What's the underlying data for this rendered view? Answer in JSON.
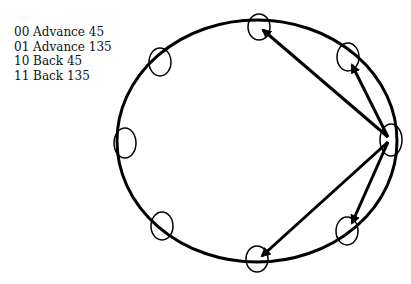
{
  "legend": {
    "items": [
      {
        "code": "00",
        "label": "Advance 45"
      },
      {
        "code": "01",
        "label": "Advance 135"
      },
      {
        "code": "10",
        "label": "Back 45"
      },
      {
        "code": "11",
        "label": "Back 135"
      }
    ]
  },
  "diagram": {
    "stroke_color": "#000000",
    "circle": {
      "cx": 257,
      "cy": 141,
      "rx": 140,
      "ry": 121
    },
    "nodes": [
      {
        "name": "node-top",
        "cx": 259,
        "cy": 27,
        "rx": 11,
        "ry": 13
      },
      {
        "name": "node-upper-right",
        "cx": 348,
        "cy": 57,
        "rx": 11,
        "ry": 14
      },
      {
        "name": "node-right",
        "cx": 391,
        "cy": 140,
        "rx": 11,
        "ry": 16
      },
      {
        "name": "node-lower-right",
        "cx": 347,
        "cy": 231,
        "rx": 11,
        "ry": 14
      },
      {
        "name": "node-bottom",
        "cx": 257,
        "cy": 259,
        "rx": 11,
        "ry": 13
      },
      {
        "name": "node-lower-left",
        "cx": 162,
        "cy": 226,
        "rx": 11,
        "ry": 14
      },
      {
        "name": "node-left",
        "cx": 125,
        "cy": 143,
        "rx": 11,
        "ry": 15
      },
      {
        "name": "node-upper-left",
        "cx": 160,
        "cy": 62,
        "rx": 11,
        "ry": 14
      }
    ],
    "arrows": [
      {
        "name": "arrow-advance-135",
        "x1": 388,
        "y1": 137,
        "x2": 263,
        "y2": 30
      },
      {
        "name": "arrow-advance-45",
        "x1": 388,
        "y1": 137,
        "x2": 352,
        "y2": 65
      },
      {
        "name": "arrow-back-45",
        "x1": 388,
        "y1": 142,
        "x2": 352,
        "y2": 223
      },
      {
        "name": "arrow-back-135",
        "x1": 388,
        "y1": 142,
        "x2": 262,
        "y2": 256
      }
    ]
  }
}
